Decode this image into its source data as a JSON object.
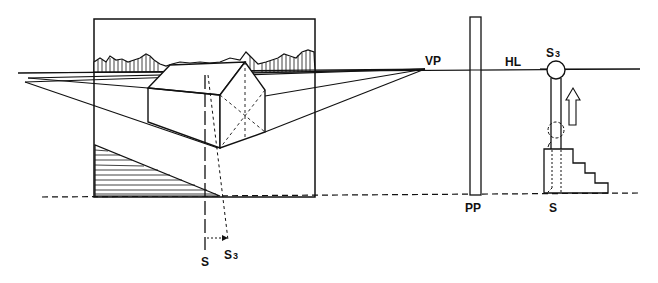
{
  "diagram": {
    "labels": {
      "vanishing_point": "VP",
      "horizon_line": "HL",
      "picture_plane": "PP",
      "station_point": "S",
      "raised_station_point": "S",
      "raised_station_point_sub": "3",
      "bottom_station_point": "S",
      "bottom_raised_point": "S",
      "bottom_raised_point_sub": "3"
    },
    "colors": {
      "ink": "#111111",
      "background": "#ffffff"
    }
  }
}
